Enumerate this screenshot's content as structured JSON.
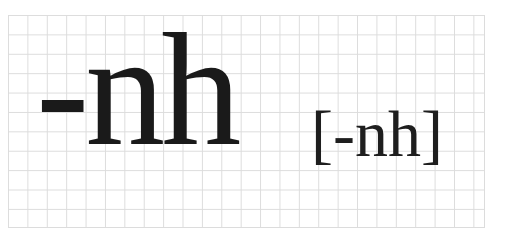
{
  "card": {
    "watermark_text": "",
    "word": "-nh",
    "pronunciation": "[-nh]",
    "grid_color": "#dcdcdc",
    "text_color": "#1a1a1a",
    "background_color": "#ffffff"
  }
}
